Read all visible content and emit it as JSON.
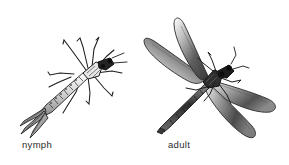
{
  "figure": {
    "background_color": "#ffffff",
    "ink_color": "#1a1a1a",
    "type": "scientific-illustration",
    "width": 289,
    "height": 165
  },
  "specimens": [
    {
      "id": "nymph",
      "label": "nymph",
      "label_x": 22,
      "label_y": 139,
      "description": "aquatic damselfly nymph, body oriented diagonally with head at upper right and segmented abdomen extending to lower left, ending in three leaf-like caudal gill filaments",
      "orientation_degrees": -35,
      "legs": 6,
      "caudal_gills": 3,
      "shading": "line-hatched, light"
    },
    {
      "id": "adult",
      "label": "adult",
      "label_x": 168,
      "label_y": 139,
      "description": "adult damselfly with four elongated dark-shaded wings spread in an X, slender segmented abdomen angled to the lower left, head with compound eyes and short antennae at upper right",
      "orientation_degrees": -40,
      "wings": 4,
      "legs": 6,
      "shading": "dense stipple gradient, dark"
    }
  ]
}
